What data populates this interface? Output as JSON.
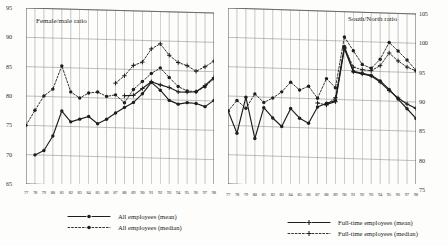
{
  "chart_data": [
    {
      "type": "line",
      "title": "Female/male ratio",
      "panel": "left",
      "xlabel": "",
      "ylabel": "",
      "ylim": [
        65,
        95
      ],
      "yticks": [
        65,
        70,
        75,
        80,
        85,
        90,
        95
      ],
      "yaxis_side": "left",
      "grid": true,
      "categories": [
        "77",
        "78",
        "79",
        "80",
        "81",
        "82",
        "83",
        "84",
        "85",
        "86",
        "87",
        "88",
        "89",
        "90",
        "91",
        "92",
        "93",
        "94",
        "95",
        "96",
        "97",
        "98"
      ],
      "series": [
        {
          "name": "All employees (mean)",
          "style": "solid",
          "marker": "filled-circle",
          "values": [
            null,
            70.0,
            70.8,
            73.3,
            77.6,
            75.8,
            76.3,
            76.8,
            75.6,
            76.4,
            77.5,
            78.5,
            79.4,
            80.9,
            82.9,
            81.6,
            79.9,
            79.3,
            79.6,
            79.5,
            79.0,
            80.1
          ]
        },
        {
          "name": "All employees (median)",
          "style": "dashed",
          "marker": "filled-circle",
          "values": [
            75.0,
            77.6,
            80.1,
            81.3,
            85.3,
            80.9,
            79.9,
            80.8,
            81.0,
            80.3,
            80.6,
            79.3,
            81.6,
            83.0,
            84.4,
            85.4,
            83.8,
            82.3,
            81.6,
            81.5,
            82.4,
            83.8
          ]
        },
        {
          "name": "Full-time employees (mean)",
          "style": "solid",
          "marker": "plus",
          "values": [
            null,
            null,
            null,
            null,
            null,
            null,
            null,
            null,
            null,
            null,
            null,
            80.5,
            80.6,
            81.8,
            83.0,
            82.5,
            82.1,
            81.4,
            81.4,
            81.5,
            82.6,
            84.0
          ]
        },
        {
          "name": "Full-time employees (median)",
          "style": "dashed",
          "marker": "plus",
          "values": [
            null,
            null,
            null,
            null,
            null,
            null,
            null,
            null,
            null,
            null,
            82.6,
            83.9,
            85.7,
            86.3,
            88.6,
            89.5,
            87.6,
            86.4,
            85.9,
            85.0,
            85.8,
            86.8
          ]
        }
      ]
    },
    {
      "type": "line",
      "title": "South/North ratio",
      "panel": "right",
      "xlabel": "",
      "ylabel": "",
      "ylim": [
        75,
        105
      ],
      "yticks": [
        75,
        80,
        85,
        90,
        95,
        100,
        105
      ],
      "yaxis_side": "right",
      "grid": true,
      "categories": [
        "77",
        "78",
        "79",
        "80",
        "81",
        "82",
        "83",
        "84",
        "85",
        "86",
        "87",
        "88",
        "89",
        "90",
        "91",
        "92",
        "93",
        "94",
        "95",
        "96",
        "97",
        "98"
      ],
      "series": [
        {
          "name": "All employees (mean)",
          "style": "solid",
          "marker": "filled-circle",
          "values": [
            87.5,
            83.7,
            89.9,
            82.9,
            88.2,
            86.5,
            85.1,
            88.2,
            86.6,
            85.8,
            88.6,
            89.3,
            89.8,
            99.1,
            94.9,
            94.6,
            94.3,
            93.4,
            92.0,
            90.4,
            88.8,
            87.2
          ]
        },
        {
          "name": "All employees (median)",
          "style": "dashed",
          "marker": "filled-circle",
          "values": [
            87.4,
            89.3,
            88.0,
            90.5,
            89.1,
            89.9,
            91.0,
            92.7,
            91.4,
            92.1,
            90.1,
            93.5,
            92.0,
            100.7,
            98.4,
            96.1,
            95.5,
            97.1,
            100.0,
            98.6,
            97.1,
            95.4
          ]
        },
        {
          "name": "Full-time employees (mean)",
          "style": "solid",
          "marker": "plus",
          "values": [
            null,
            null,
            null,
            null,
            null,
            null,
            null,
            null,
            null,
            null,
            null,
            89.1,
            89.6,
            98.7,
            94.8,
            94.5,
            94.2,
            93.2,
            91.8,
            90.6,
            89.6,
            88.9
          ]
        },
        {
          "name": "Full-time employees (median)",
          "style": "dashed",
          "marker": "plus",
          "values": [
            null,
            null,
            null,
            null,
            null,
            null,
            null,
            null,
            null,
            null,
            89.3,
            89.0,
            90.3,
            98.9,
            95.6,
            95.2,
            95.1,
            96.0,
            98.2,
            96.9,
            95.9,
            95.3
          ]
        }
      ]
    }
  ],
  "panels": {
    "left": {
      "title": "Female/male ratio",
      "yticks": [
        "65",
        "70",
        "75",
        "80",
        "85",
        "90",
        "95"
      ],
      "xticks": [
        "77",
        "78",
        "79",
        "80",
        "81",
        "82",
        "83",
        "84",
        "85",
        "86",
        "87",
        "88",
        "89",
        "90",
        "91",
        "92",
        "93",
        "94",
        "95",
        "96",
        "97",
        "98"
      ]
    },
    "right": {
      "title": "South/North ratio",
      "yticks": [
        "75",
        "80",
        "85",
        "90",
        "95",
        "100",
        "105"
      ],
      "xticks": [
        "77",
        "78",
        "79",
        "80",
        "81",
        "82",
        "83",
        "84",
        "85",
        "86",
        "87",
        "88",
        "89",
        "90",
        "91",
        "92",
        "93",
        "94",
        "95",
        "96",
        "97",
        "98"
      ]
    }
  },
  "legend": {
    "all": [
      {
        "label": "All employees (mean)",
        "style": "solid",
        "marker": "filled-circle"
      },
      {
        "label": "All employees (median)",
        "style": "dashed",
        "marker": "filled-circle"
      }
    ],
    "fulltime": [
      {
        "label": "Full-time employees (mean)",
        "style": "solid",
        "marker": "plus"
      },
      {
        "label": "Full-time employees (median)",
        "style": "dashed",
        "marker": "plus"
      }
    ]
  },
  "colors": {
    "ink": "#1e1e1e",
    "grid": "#8a8a8a",
    "axis": "#555555",
    "background": "#fdfdfc"
  }
}
